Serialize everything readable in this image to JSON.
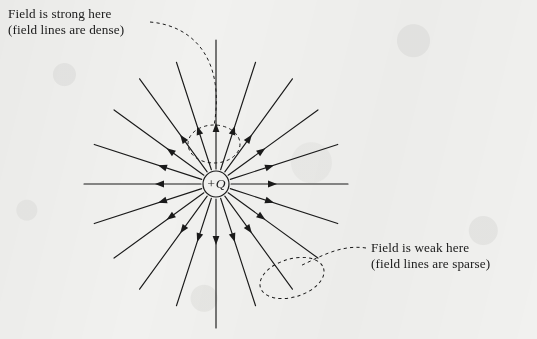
{
  "figure": {
    "type": "electric-field-line-diagram",
    "background_color": "#f1f1ef",
    "ink_color": "#1a1a1a"
  },
  "charge": {
    "label": "+Q",
    "sign": "positive",
    "center_x": 216,
    "center_y": 184,
    "radius": 13,
    "field_direction": "outward"
  },
  "annotations": [
    {
      "id": "strong",
      "line1": "Field is strong here",
      "line2": "(field lines are dense)",
      "x": 8,
      "y": 6,
      "points_to": "dense-region-ellipse"
    },
    {
      "id": "weak",
      "line1": "Field is weak here",
      "line2": "(field lines are sparse)",
      "x": 371,
      "y": 240,
      "points_to": "sparse-region-ellipse"
    }
  ],
  "highlight_regions": [
    {
      "id": "dense-region-ellipse",
      "name": "dense-region",
      "cx": 214,
      "cy": 144,
      "rx": 26,
      "ry": 19,
      "rotation": 0,
      "style": "dashed"
    },
    {
      "id": "sparse-region-ellipse",
      "name": "sparse-region",
      "cx": 292,
      "cy": 278,
      "rx": 33,
      "ry": 19,
      "rotation": -17,
      "style": "dashed"
    }
  ],
  "chart_data": {
    "type": "scatter",
    "xlabel": "",
    "ylabel": "",
    "center": [
      216,
      184
    ],
    "line_count": 20,
    "angle_step_degrees": 18,
    "inner_radius": 15,
    "outer_radius": 132,
    "arrow_radius": 52,
    "arrow_length": 9,
    "arrow_half_width": 3.4,
    "angles_degrees": [
      0,
      18,
      36,
      54,
      72,
      90,
      108,
      126,
      144,
      162,
      180,
      198,
      216,
      234,
      252,
      270,
      288,
      306,
      324,
      342
    ],
    "line_lengths": [
      132,
      128,
      126,
      130,
      128,
      144,
      128,
      130,
      126,
      128,
      132,
      128,
      126,
      130,
      128,
      144,
      128,
      130,
      126,
      128
    ],
    "legend": [
      "field line",
      "arrow shows field direction"
    ],
    "grid": false
  }
}
